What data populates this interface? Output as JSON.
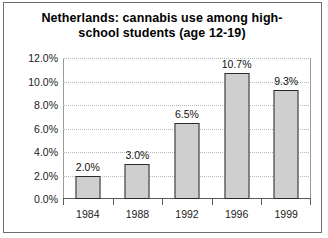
{
  "chart_data": {
    "type": "bar",
    "title_line1": "Netherlands: cannabis use among high-",
    "title_line2": "school students (age 12-19)",
    "categories": [
      "1984",
      "1988",
      "1992",
      "1996",
      "1999"
    ],
    "values": [
      2.0,
      3.0,
      6.5,
      10.7,
      9.3
    ],
    "value_labels": [
      "2.0%",
      "3.0%",
      "6.5%",
      "10.7%",
      "9.3%"
    ],
    "xlabel": "",
    "ylabel": "",
    "ylim": [
      0,
      12
    ],
    "ytick_values": [
      0,
      2,
      4,
      6,
      8,
      10,
      12
    ],
    "ytick_labels": [
      "0.0%",
      "2.0%",
      "4.0%",
      "6.0%",
      "8.0%",
      "10.0%",
      "12.0%"
    ],
    "grid": true,
    "grid_axis": "y",
    "legend": false,
    "colors": {
      "bar_fill": "#cfcfcf",
      "bar_border": "#2b2b2b",
      "gridline": "#b8b8b8",
      "axis": "#5a5a5a",
      "frame": "#6e6e6e",
      "text": "#111111",
      "background": "#ffffff"
    }
  }
}
